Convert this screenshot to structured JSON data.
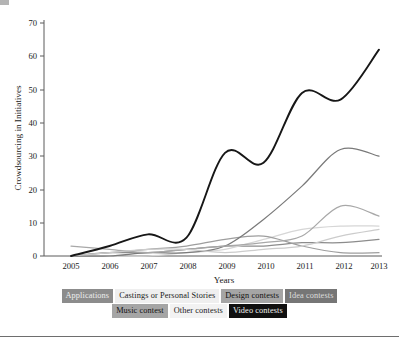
{
  "chart_data": {
    "type": "line",
    "title": "",
    "xlabel": "Years",
    "ylabel": "Crowdsourcing in Initiatives",
    "x": [
      2005,
      2006,
      2007,
      2008,
      2009,
      2010,
      2011,
      2012,
      2013
    ],
    "xtick_labels": [
      "2005",
      "2006",
      "2007",
      "2008",
      "2009",
      "2010",
      "2011",
      "2012",
      "2013"
    ],
    "ytick_labels": [
      "0",
      "10",
      "20",
      "30",
      "40",
      "50",
      "60",
      "70"
    ],
    "yticks": [
      0,
      10,
      20,
      30,
      40,
      50,
      60,
      70
    ],
    "ylim": [
      0,
      70
    ],
    "xlim": [
      2005,
      2013
    ],
    "grid": false,
    "legend_position": "bottom",
    "series": [
      {
        "name": "Applications",
        "color": "#8c8c8c",
        "values": [
          0,
          1,
          1,
          2,
          3,
          3,
          4,
          4,
          5
        ]
      },
      {
        "name": "Castings or Personal Stories",
        "color": "#d6d6d6",
        "values": [
          0,
          0,
          0,
          1,
          2,
          5,
          8,
          9,
          9
        ]
      },
      {
        "name": "Design contests",
        "color": "#9e9e9e",
        "values": [
          0,
          1,
          2,
          3,
          5,
          6,
          3,
          1,
          1
        ]
      },
      {
        "name": "Idea contests",
        "color": "#7a7a7a",
        "values": [
          0,
          0,
          1,
          1,
          3,
          11,
          21,
          32,
          30
        ]
      },
      {
        "name": "Music contest",
        "color": "#a8a8a8",
        "values": [
          3,
          2,
          1,
          2,
          3,
          4,
          6,
          15,
          12
        ]
      },
      {
        "name": "Other contests",
        "color": "#cccccc",
        "values": [
          0,
          1,
          2,
          2,
          1,
          2,
          3,
          6,
          8
        ]
      },
      {
        "name": "Video contests",
        "color": "#171717",
        "values": [
          0,
          3,
          6.5,
          5.5,
          31,
          28,
          49,
          47,
          62
        ]
      }
    ]
  },
  "axes": {
    "y_label": "Crowdsourcing in Initiatives",
    "x_label": "Years",
    "x_ticks": [
      "2005",
      "2006",
      "2007",
      "2008",
      "2009",
      "2010",
      "2011",
      "2012",
      "2013"
    ],
    "y_ticks": [
      "0",
      "10",
      "20",
      "30",
      "40",
      "50",
      "60",
      "70"
    ]
  },
  "legend": {
    "rows": [
      [
        {
          "label": "Applications",
          "bg": "#8c8c8c",
          "fg": "#eeeeee"
        },
        {
          "label": "Castings or Personal Stories",
          "bg": "#efefef",
          "fg": "#1a1a1a"
        },
        {
          "label": "Design contests",
          "bg": "#a5a5a5",
          "fg": "#111111"
        },
        {
          "label": "Idea contests",
          "bg": "#767676",
          "fg": "#dddddd"
        }
      ],
      [
        {
          "label": "Music contest",
          "bg": "#a5a5a5",
          "fg": "#111111"
        },
        {
          "label": "Other contests",
          "bg": "#f2f2f2",
          "fg": "#1a1a1a"
        },
        {
          "label": "Video contests",
          "bg": "#101010",
          "fg": "#f2f2f2"
        }
      ]
    ]
  }
}
